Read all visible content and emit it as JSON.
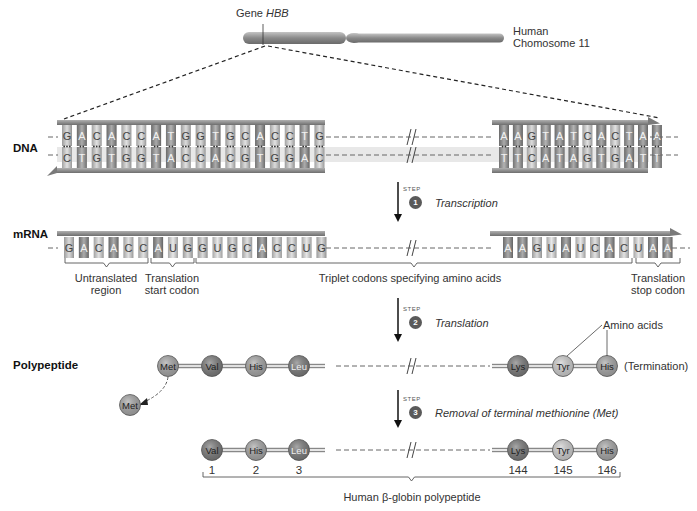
{
  "chromosome": {
    "gene_label_prefix": "Gene ",
    "gene_label_name": "HBB",
    "name_line1": "Human",
    "name_line2": "Chomosome 11",
    "colors": {
      "body": "#8a8a8a",
      "highlight": "#b8b8b8"
    }
  },
  "rows": {
    "dna": "DNA",
    "mrna": "mRNA",
    "polypeptide": "Polypeptide"
  },
  "dna": {
    "left_top": [
      "G",
      "A",
      "C",
      "A",
      "C",
      "C",
      "A",
      "T",
      "G",
      "G",
      "T",
      "G",
      "C",
      "A",
      "C",
      "C",
      "T",
      "G"
    ],
    "left_bottom": [
      "C",
      "T",
      "G",
      "T",
      "G",
      "G",
      "T",
      "A",
      "C",
      "C",
      "A",
      "C",
      "G",
      "T",
      "G",
      "G",
      "A",
      "C"
    ],
    "right_top": [
      "A",
      "A",
      "G",
      "T",
      "A",
      "T",
      "C",
      "A",
      "C",
      "T",
      "A",
      "A"
    ],
    "right_bottom": [
      "T",
      "T",
      "C",
      "A",
      "T",
      "A",
      "G",
      "T",
      "G",
      "A",
      "T",
      "T"
    ],
    "break_symbol": "//"
  },
  "mrna": {
    "left": [
      "G",
      "A",
      "C",
      "A",
      "C",
      "C",
      "A",
      "U",
      "G",
      "G",
      "U",
      "G",
      "C",
      "A",
      "C",
      "C",
      "U",
      "G"
    ],
    "right": [
      "A",
      "A",
      "G",
      "U",
      "A",
      "U",
      "C",
      "A",
      "C",
      "U",
      "A",
      "A"
    ],
    "regions": [
      {
        "line1": "Untranslated",
        "line2": "region"
      },
      {
        "line1": "Translation",
        "line2": "start codon"
      },
      {
        "line1": "Triplet codons specifying amino acids",
        "line2": ""
      },
      {
        "line1": "Translation",
        "line2": "stop codon"
      }
    ]
  },
  "steps": [
    {
      "word": "STEP",
      "number": "1",
      "label": "Transcription"
    },
    {
      "word": "STEP",
      "number": "2",
      "label": "Translation"
    },
    {
      "word": "STEP",
      "number": "3",
      "label": "Removal of terminal methionine (Met)"
    }
  ],
  "polypeptide": {
    "left": [
      "Met",
      "Val",
      "His",
      "Leu"
    ],
    "right": [
      "Lys",
      "Tyr",
      "His"
    ],
    "released": "Met",
    "amino_acids_callout": "Amino acids",
    "termination": "(Termination)"
  },
  "final": {
    "left": [
      "Val",
      "His",
      "Leu"
    ],
    "right": [
      "Lys",
      "Tyr",
      "His"
    ],
    "left_positions": [
      "1",
      "2",
      "3"
    ],
    "right_positions": [
      "144",
      "145",
      "146"
    ],
    "caption": "Human β-globin polypeptide"
  },
  "colors": {
    "base_A": "#8e8e8e",
    "base_T": "#9a9a9a",
    "base_G": "#cfcfcf",
    "base_C": "#d8d8d8",
    "base_U": "#e0e0e0",
    "backbone": "#8c8c8c",
    "aa_dark": "#7a7a7a",
    "aa_mid": "#a6a6a6",
    "aa_light": "#cfcfcf"
  }
}
